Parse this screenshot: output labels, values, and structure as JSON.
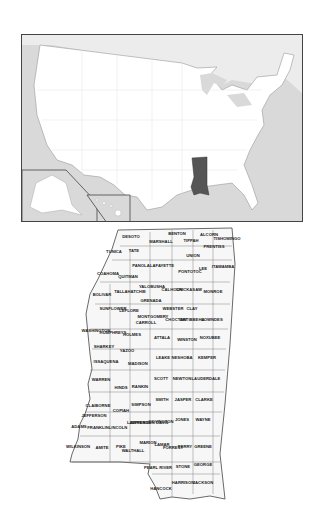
{
  "figure": {
    "locator_map": {
      "highlighted_state": "Mississippi",
      "highlight_color": "#555555",
      "land_color": "#ffffff",
      "water_color": "#d9d9d9",
      "insets": [
        "Alaska",
        "Hawaii"
      ]
    },
    "county_map": {
      "state": "Mississippi",
      "counties": [
        {
          "name": "DESOTO",
          "x": 71,
          "y": 14
        },
        {
          "name": "MARSHALL",
          "x": 101,
          "y": 19
        },
        {
          "name": "BENTON",
          "x": 117,
          "y": 11
        },
        {
          "name": "TIPPAH",
          "x": 131,
          "y": 18
        },
        {
          "name": "ALCORN",
          "x": 149,
          "y": 12
        },
        {
          "name": "TISHOMINGO",
          "x": 167,
          "y": 16
        },
        {
          "name": "PRENTISS",
          "x": 154,
          "y": 24
        },
        {
          "name": "TUNICA",
          "x": 54,
          "y": 29
        },
        {
          "name": "TATE",
          "x": 74,
          "y": 28
        },
        {
          "name": "UNION",
          "x": 133,
          "y": 33
        },
        {
          "name": "PANOLA",
          "x": 81,
          "y": 43
        },
        {
          "name": "LAFAYETTE",
          "x": 102,
          "y": 43
        },
        {
          "name": "PONTOTOC",
          "x": 130,
          "y": 49
        },
        {
          "name": "LEE",
          "x": 143,
          "y": 46
        },
        {
          "name": "ITAWAMBA",
          "x": 163,
          "y": 44
        },
        {
          "name": "COAHOMA",
          "x": 48,
          "y": 51
        },
        {
          "name": "QUITMAN",
          "x": 68,
          "y": 54
        },
        {
          "name": "TALLAHATCHIE",
          "x": 70,
          "y": 69
        },
        {
          "name": "YALOBUSHA",
          "x": 92,
          "y": 64
        },
        {
          "name": "CALHOUN",
          "x": 112,
          "y": 67
        },
        {
          "name": "CHICKASAW",
          "x": 129,
          "y": 67
        },
        {
          "name": "MONROE",
          "x": 153,
          "y": 69
        },
        {
          "name": "BOLIVAR",
          "x": 42,
          "y": 72
        },
        {
          "name": "GRENADA",
          "x": 91,
          "y": 78
        },
        {
          "name": "SUNFLOWER",
          "x": 53,
          "y": 86
        },
        {
          "name": "LEFLORE",
          "x": 69,
          "y": 88
        },
        {
          "name": "MONTGOMERY",
          "x": 93,
          "y": 94
        },
        {
          "name": "WEBSTER",
          "x": 113,
          "y": 86
        },
        {
          "name": "CLAY",
          "x": 132,
          "y": 86
        },
        {
          "name": "CHOCTAW",
          "x": 116,
          "y": 97
        },
        {
          "name": "OKTIBBEHA",
          "x": 132,
          "y": 97
        },
        {
          "name": "LOWNDES",
          "x": 152,
          "y": 97
        },
        {
          "name": "CARROLL",
          "x": 86,
          "y": 100
        },
        {
          "name": "WASHINGTON",
          "x": 36,
          "y": 108
        },
        {
          "name": "HUMPHREYS",
          "x": 53,
          "y": 110
        },
        {
          "name": "HOLMES",
          "x": 72,
          "y": 112
        },
        {
          "name": "ATTALA",
          "x": 102,
          "y": 115
        },
        {
          "name": "WINSTON",
          "x": 127,
          "y": 117
        },
        {
          "name": "NOXUBEE",
          "x": 150,
          "y": 115
        },
        {
          "name": "SHARKEY",
          "x": 44,
          "y": 124
        },
        {
          "name": "YAZOO",
          "x": 67,
          "y": 128
        },
        {
          "name": "ISSAQUENA",
          "x": 46,
          "y": 139
        },
        {
          "name": "MADISON",
          "x": 78,
          "y": 141
        },
        {
          "name": "LEAKE",
          "x": 103,
          "y": 135
        },
        {
          "name": "NESHOBA",
          "x": 122,
          "y": 135
        },
        {
          "name": "KEMPER",
          "x": 147,
          "y": 135
        },
        {
          "name": "WARREN",
          "x": 41,
          "y": 157
        },
        {
          "name": "HINDS",
          "x": 61,
          "y": 165
        },
        {
          "name": "RANKIN",
          "x": 80,
          "y": 164
        },
        {
          "name": "SCOTT",
          "x": 101,
          "y": 156
        },
        {
          "name": "NEWTON",
          "x": 122,
          "y": 156
        },
        {
          "name": "LAUDERDALE",
          "x": 146,
          "y": 156
        },
        {
          "name": "CLAIBORNE",
          "x": 38,
          "y": 183
        },
        {
          "name": "COPIAH",
          "x": 61,
          "y": 188
        },
        {
          "name": "SIMPSON",
          "x": 81,
          "y": 182
        },
        {
          "name": "SMITH",
          "x": 102,
          "y": 177
        },
        {
          "name": "JASPER",
          "x": 123,
          "y": 177
        },
        {
          "name": "CLARKE",
          "x": 144,
          "y": 177
        },
        {
          "name": "JEFFERSON",
          "x": 34,
          "y": 193
        },
        {
          "name": "LAWRENCE",
          "x": 79,
          "y": 200
        },
        {
          "name": "JEFFERSON DAVIS",
          "x": 89,
          "y": 200
        },
        {
          "name": "COVINGTON",
          "x": 101,
          "y": 199
        },
        {
          "name": "JONES",
          "x": 122,
          "y": 197
        },
        {
          "name": "WAYNE",
          "x": 143,
          "y": 197
        },
        {
          "name": "ADAMS",
          "x": 19,
          "y": 204
        },
        {
          "name": "FRANKLIN",
          "x": 38,
          "y": 205
        },
        {
          "name": "LINCOLN",
          "x": 58,
          "y": 205
        },
        {
          "name": "WILKINSON",
          "x": 18,
          "y": 224
        },
        {
          "name": "AMITE",
          "x": 42,
          "y": 225
        },
        {
          "name": "PIKE",
          "x": 61,
          "y": 224
        },
        {
          "name": "WALTHALL",
          "x": 73,
          "y": 228
        },
        {
          "name": "MARION",
          "x": 88,
          "y": 220
        },
        {
          "name": "LAMAR",
          "x": 102,
          "y": 222
        },
        {
          "name": "FORREST",
          "x": 113,
          "y": 225
        },
        {
          "name": "PERRY",
          "x": 125,
          "y": 224
        },
        {
          "name": "GREENE",
          "x": 143,
          "y": 224
        },
        {
          "name": "PEARL RIVER",
          "x": 98,
          "y": 245
        },
        {
          "name": "STONE",
          "x": 123,
          "y": 244
        },
        {
          "name": "GEORGE",
          "x": 143,
          "y": 242
        },
        {
          "name": "HANCOCK",
          "x": 101,
          "y": 266
        },
        {
          "name": "HARRISON",
          "x": 123,
          "y": 260
        },
        {
          "name": "JACKSON",
          "x": 143,
          "y": 260
        }
      ]
    }
  }
}
